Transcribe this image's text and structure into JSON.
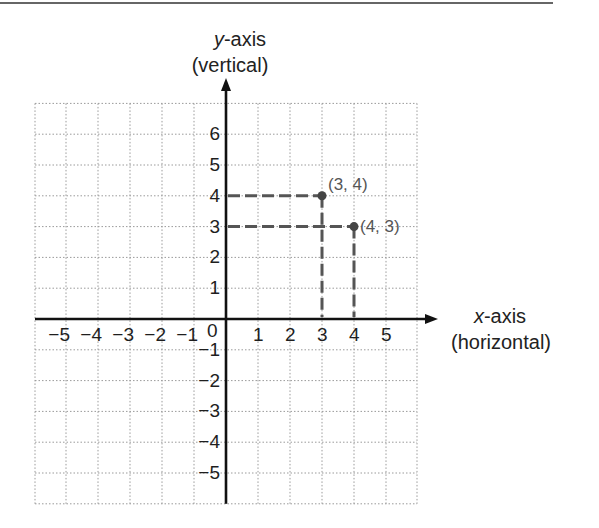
{
  "figure": {
    "top_rule": true,
    "y_axis": {
      "title_var": "y",
      "title_rest": "-axis",
      "subtitle": "(vertical)"
    },
    "x_axis": {
      "title_var": "x",
      "title_rest": "-axis",
      "subtitle": "(horizontal)"
    },
    "origin_label": "0",
    "x_tick_labels": [
      {
        "v": -5,
        "text": "−5"
      },
      {
        "v": -4,
        "text": "−4"
      },
      {
        "v": -3,
        "text": "−3"
      },
      {
        "v": -2,
        "text": "−2"
      },
      {
        "v": -1,
        "text": "−1"
      },
      {
        "v": 1,
        "text": "1"
      },
      {
        "v": 2,
        "text": "2"
      },
      {
        "v": 3,
        "text": "3"
      },
      {
        "v": 4,
        "text": "4"
      },
      {
        "v": 5,
        "text": "5"
      }
    ],
    "y_tick_labels": [
      {
        "v": 6,
        "text": "6"
      },
      {
        "v": 5,
        "text": "5"
      },
      {
        "v": 4,
        "text": "4"
      },
      {
        "v": 3,
        "text": "3"
      },
      {
        "v": 2,
        "text": "2"
      },
      {
        "v": 1,
        "text": "1"
      },
      {
        "v": -1,
        "text": "−1"
      },
      {
        "v": -2,
        "text": "−2"
      },
      {
        "v": -3,
        "text": "−3"
      },
      {
        "v": -4,
        "text": "−4"
      },
      {
        "v": -5,
        "text": "−5"
      }
    ],
    "points": [
      {
        "x": 3,
        "y": 4,
        "label": "(3, 4)"
      },
      {
        "x": 4,
        "y": 3,
        "label": "(4, 3)"
      }
    ],
    "grid": {
      "x_min": -6,
      "x_max": 6,
      "y_min": -6,
      "y_max": 7,
      "style": "dotted"
    },
    "colors": {
      "axis": "#111111",
      "grid": "#9a9a9a",
      "dash": "#555555",
      "point": "#444444",
      "point_label": "#555555"
    }
  }
}
